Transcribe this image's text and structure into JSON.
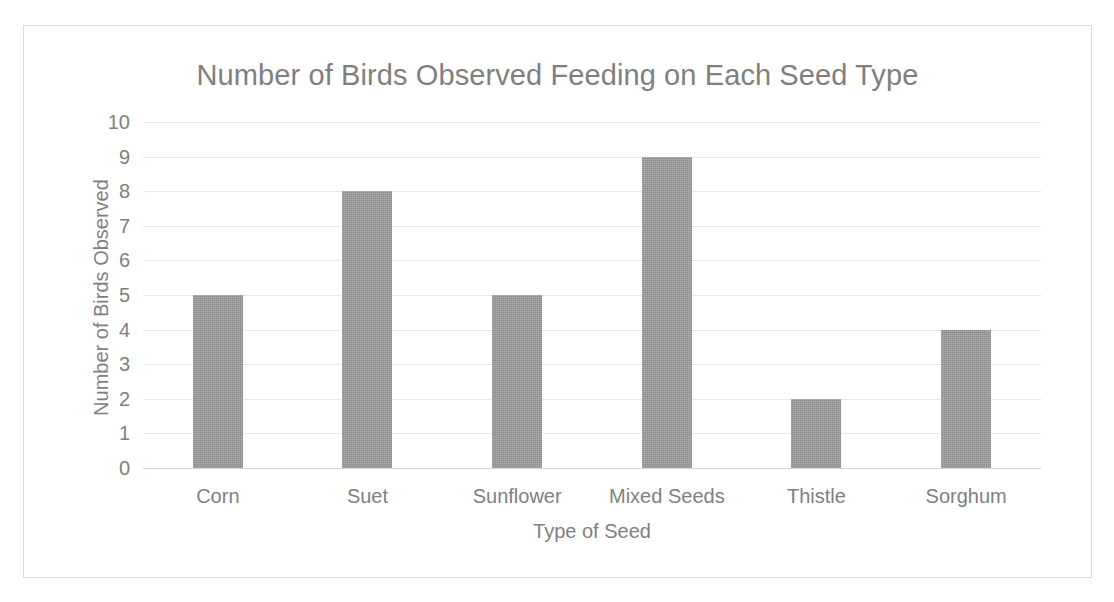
{
  "chart_data": {
    "type": "bar",
    "title": "Number of Birds Observed Feeding on Each Seed Type",
    "xlabel": "Type of Seed",
    "ylabel": "Number of Birds Observed",
    "categories": [
      "Corn",
      "Suet",
      "Sunflower",
      "Mixed Seeds",
      "Thistle",
      "Sorghum"
    ],
    "values": [
      5,
      8,
      5,
      9,
      2,
      4
    ],
    "ylim": [
      0,
      10
    ],
    "ytick_labels": [
      "10",
      "9",
      "8",
      "7",
      "6",
      "5",
      "4",
      "3",
      "2",
      "1",
      "0"
    ],
    "ytick_values": [
      10,
      9,
      8,
      7,
      6,
      5,
      4,
      3,
      2,
      1,
      0
    ],
    "grid": true,
    "legend": false,
    "series": [
      {
        "name": "Number of Birds Observed",
        "values": [
          5,
          8,
          5,
          9,
          2,
          4
        ]
      }
    ]
  },
  "style": {
    "bar_color": "#9a9a9a",
    "text_color": "#7f7f7f",
    "gridline_color": "#e8e8e8",
    "border_color": "#dcdcdc",
    "background": "#ffffff"
  }
}
